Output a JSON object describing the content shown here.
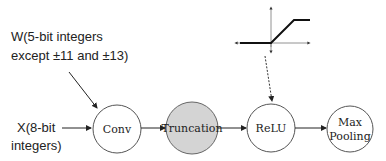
{
  "weights_label": {
    "line1": "W(5-bit integers",
    "line2": "except ±11 and ±13)"
  },
  "input_label": {
    "line1": "X(8-bit",
    "line2": "integers)"
  },
  "nodes": [
    {
      "id": "conv",
      "label": "Conv",
      "fill": "#ffffff"
    },
    {
      "id": "truncation",
      "label": "Truncation",
      "fill": "#d4d4d4"
    },
    {
      "id": "relu",
      "label": "ReLU",
      "fill": "#ffffff"
    },
    {
      "id": "maxpool",
      "label_line1": "Max",
      "label_line2": "Pooling",
      "fill": "#ffffff"
    }
  ],
  "relu_graph": {
    "description": "clipped ReLU activation plot"
  }
}
